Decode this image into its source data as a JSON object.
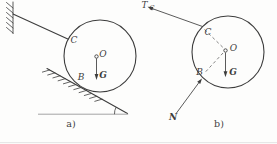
{
  "colors": {
    "line": "#3d3d3d",
    "dashed_line": "#6b6b6b",
    "light_line": "#9a9a9a",
    "caption": "#3f3f3f",
    "page_border": "#e2e2e2",
    "background": "#fdfdfc"
  },
  "figure_a": {
    "caption": "a)",
    "point_c_label": "C",
    "center_label": "O",
    "weight_label": "G",
    "point_b_label": "B"
  },
  "figure_b": {
    "caption": "b)",
    "tension_label": "T",
    "tension_subscript": "C",
    "point_c_label": "C",
    "center_label": "O",
    "weight_label": "G",
    "point_b_label": "B",
    "normal_label": "N"
  }
}
